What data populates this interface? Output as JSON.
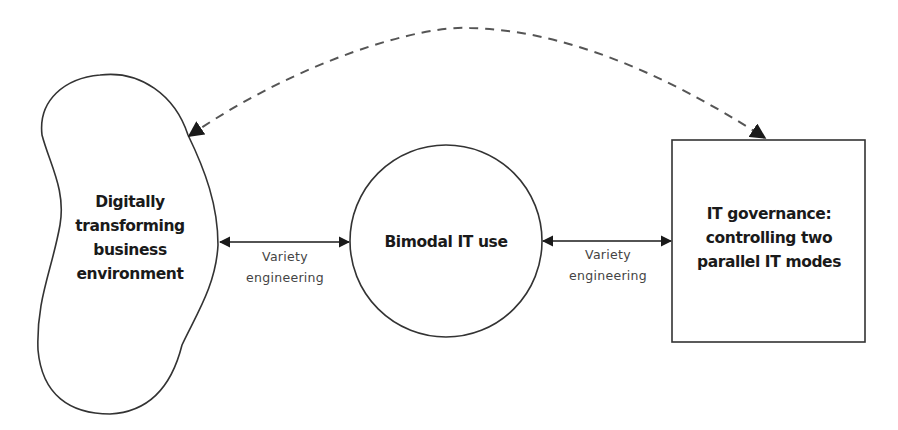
{
  "diagram": {
    "type": "concept-relationship",
    "colors": {
      "stroke": "#333333",
      "dashed_stroke": "#555555",
      "node_text": "#1a1a1a",
      "edge_text": "#444444",
      "background": "#ffffff"
    },
    "nodes": [
      {
        "id": "environment",
        "shape": "blob",
        "lines": [
          "Digitally",
          "transforming",
          "business",
          "environment"
        ]
      },
      {
        "id": "bimodal",
        "shape": "circle",
        "lines": [
          "Bimodal IT use"
        ]
      },
      {
        "id": "governance",
        "shape": "rectangle",
        "lines": [
          "IT governance:",
          "controlling two",
          "parallel IT modes"
        ]
      }
    ],
    "edges": [
      {
        "from": "environment",
        "to": "bimodal",
        "style": "solid",
        "direction": "bidirectional",
        "label_lines": [
          "Variety",
          "engineering"
        ]
      },
      {
        "from": "bimodal",
        "to": "governance",
        "style": "solid",
        "direction": "bidirectional",
        "label_lines": [
          "Variety",
          "engineering"
        ]
      },
      {
        "from": "environment",
        "to": "governance",
        "style": "dashed",
        "direction": "bidirectional",
        "label_lines": []
      }
    ]
  }
}
